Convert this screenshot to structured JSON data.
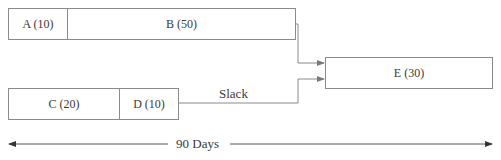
{
  "diagram": {
    "tasks": [
      {
        "id": "A",
        "label": "A (10)",
        "duration": 10
      },
      {
        "id": "B",
        "label": "B (50)",
        "duration": 50
      },
      {
        "id": "C",
        "label": "C (20)",
        "duration": 20
      },
      {
        "id": "D",
        "label": "D (10)",
        "duration": 10
      },
      {
        "id": "E",
        "label": "E (30)",
        "duration": 30
      }
    ],
    "slack_label": "Slack",
    "timeline_label": "90 Days",
    "colors": {
      "line": "#8a8a8a",
      "arrow": "#7a7a7a",
      "text": "#3a3a3a"
    }
  }
}
